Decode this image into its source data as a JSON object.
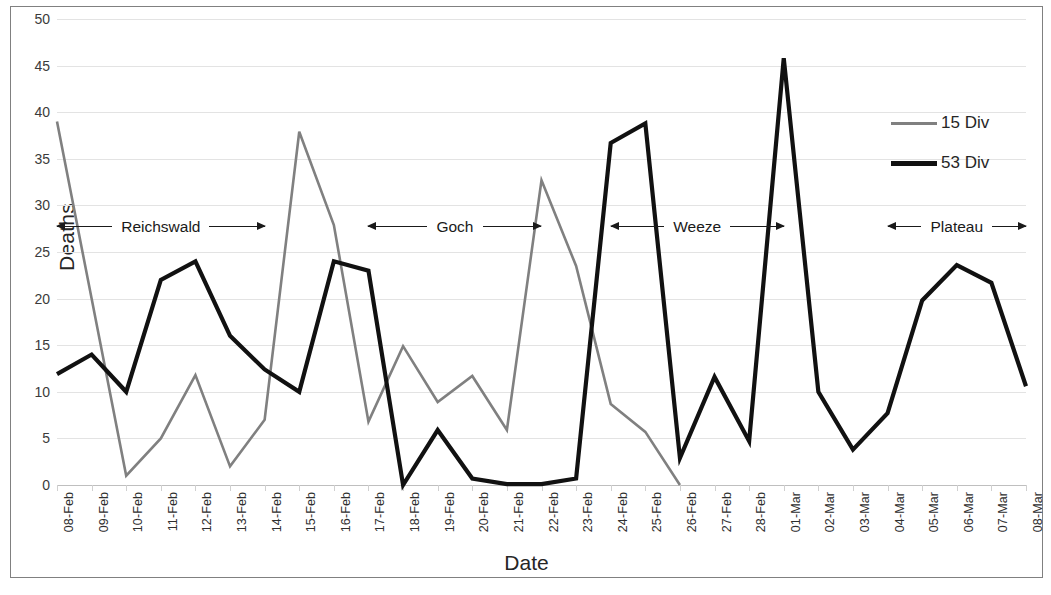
{
  "chart_data": {
    "type": "line",
    "title": "",
    "xlabel": "Date",
    "ylabel": "Deaths",
    "ylim": [
      0,
      50
    ],
    "ytick_step": 5,
    "yticks": [
      "0",
      "5",
      "10",
      "15",
      "20",
      "25",
      "30",
      "35",
      "40",
      "45",
      "50"
    ],
    "grid": true,
    "legend_position": "right",
    "categories": [
      "08-Feb",
      "09-Feb",
      "10-Feb",
      "11-Feb",
      "12-Feb",
      "13-Feb",
      "14-Feb",
      "15-Feb",
      "16-Feb",
      "17-Feb",
      "18-Feb",
      "19-Feb",
      "20-Feb",
      "21-Feb",
      "22-Feb",
      "23-Feb",
      "24-Feb",
      "25-Feb",
      "26-Feb",
      "27-Feb",
      "28-Feb",
      "01-Mar",
      "02-Mar",
      "03-Mar",
      "04-Mar",
      "05-Mar",
      "06-Mar",
      "07-Mar",
      "08-Mar"
    ],
    "series": [
      {
        "name": "15 Div",
        "color": "#808080",
        "width": 2.6,
        "values": [
          39,
          20,
          1,
          5,
          11.8,
          2,
          7,
          37.9,
          27.9,
          6.8,
          14.9,
          8.9,
          11.7,
          5.9,
          32.7,
          23.5,
          8.7,
          5.7,
          0,
          null,
          null,
          null,
          null,
          null,
          null,
          null,
          null,
          null,
          null
        ]
      },
      {
        "name": "53 Div",
        "color": "#111111",
        "width": 4.2,
        "values": [
          11.9,
          14,
          10,
          22,
          24,
          16,
          12.4,
          10,
          24,
          23,
          0,
          5.9,
          0.7,
          0.1,
          0.1,
          0.7,
          36.7,
          38.8,
          2.9,
          11.6,
          4.7,
          45.8,
          10,
          3.8,
          7.7,
          19.8,
          23.6,
          21.7,
          10.6
        ]
      }
    ],
    "annotations": [
      {
        "label": "Reichswald",
        "start_index": 0,
        "end_index": 6,
        "y_value": 27.7
      },
      {
        "label": "Goch",
        "start_index": 9,
        "end_index": 14,
        "y_value": 27.7
      },
      {
        "label": "Weeze",
        "start_index": 16,
        "end_index": 21,
        "y_value": 27.7
      },
      {
        "label": "Plateau",
        "start_index": 24,
        "end_index": 28,
        "y_value": 27.7
      }
    ]
  },
  "axes": {
    "y_title": "Deaths",
    "x_title": "Date"
  },
  "legend": {
    "entries": [
      {
        "label": "15 Div",
        "color": "#808080",
        "thickness": "3px"
      },
      {
        "label": "53 Div",
        "color": "#111111",
        "thickness": "5px"
      }
    ]
  },
  "style": {
    "frame_color": "#808080",
    "grid_color": "#e3e3e3",
    "background": "#ffffff",
    "text_color": "#262626"
  }
}
